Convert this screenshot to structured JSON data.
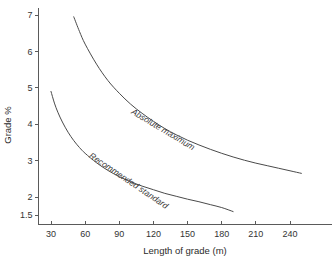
{
  "chart_data": {
    "type": "line",
    "title": "",
    "xlabel": "Length of grade (m)",
    "ylabel": "Grade %",
    "xlim": [
      20,
      255
    ],
    "ylim": [
      1.28,
      7.2
    ],
    "grid": false,
    "legend_position": "inline-curve-labels",
    "xticks": [
      30,
      60,
      90,
      120,
      150,
      180,
      210,
      240
    ],
    "xticklabels": [
      "30",
      "60",
      "90",
      "120",
      "150",
      "180",
      "210",
      "240"
    ],
    "yticks": [
      1.5,
      2,
      3,
      4,
      5,
      6,
      7
    ],
    "yticklabels": [
      "1.5",
      "2",
      "3",
      "4",
      "5",
      "6",
      "7"
    ],
    "series": [
      {
        "name": "Absolute maximum",
        "label_x": 100,
        "label_y": 4.3,
        "label_rotation": 31,
        "x": [
          50,
          55,
          60,
          70,
          80,
          90,
          100,
          110,
          120,
          130,
          140,
          150,
          160,
          170,
          180,
          190,
          200,
          210,
          220,
          230,
          240,
          250
        ],
        "y": [
          6.95,
          6.55,
          6.2,
          5.65,
          5.2,
          4.85,
          4.55,
          4.3,
          4.08,
          3.88,
          3.71,
          3.56,
          3.43,
          3.31,
          3.2,
          3.1,
          3.01,
          2.93,
          2.86,
          2.79,
          2.72,
          2.65
        ]
      },
      {
        "name": "Recommended standard",
        "label_x": 63,
        "label_y": 3.1,
        "label_rotation": 34,
        "x": [
          30,
          33,
          36,
          40,
          45,
          50,
          55,
          60,
          70,
          80,
          90,
          100,
          110,
          120,
          130,
          140,
          150,
          160,
          170,
          180,
          190
        ],
        "y": [
          4.9,
          4.58,
          4.33,
          4.06,
          3.78,
          3.55,
          3.36,
          3.2,
          2.94,
          2.73,
          2.56,
          2.42,
          2.3,
          2.2,
          2.1,
          2.02,
          1.94,
          1.87,
          1.79,
          1.71,
          1.6
        ]
      }
    ],
    "colors": {
      "background": "#ffffff",
      "axis": "#5a5a5a",
      "curve": "#4a4a4a",
      "text": "#2b2b2b"
    }
  }
}
